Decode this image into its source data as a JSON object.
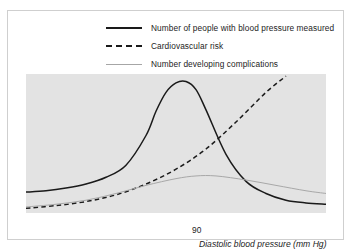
{
  "chart_data": {
    "type": "line",
    "title": "",
    "xlabel": "Diastolic blood pressure (mm Hg)",
    "ylabel": "",
    "xtick_labels": [
      "90"
    ],
    "xtick_positions": [
      90
    ],
    "grid": false,
    "legend_position": "top",
    "plot_background": "#e3e3e3",
    "series": [
      {
        "name": "Number of people with blood pressure measured",
        "style": "solid",
        "color": "#1a1a1a",
        "shape": "bell-curve peaking just left of 90, falling away to the right",
        "x": [
          60,
          64,
          68,
          72,
          76,
          80,
          84,
          86,
          88,
          90,
          92,
          94,
          96,
          100,
          104,
          108,
          112,
          116,
          120
        ],
        "y": [
          14,
          15,
          17,
          20,
          25,
          34,
          56,
          74,
          88,
          95,
          96,
          90,
          75,
          42,
          22,
          13,
          8,
          6,
          5
        ]
      },
      {
        "name": "Cardiovascular risk",
        "style": "dashed",
        "color": "#1a1a1a",
        "shape": "exponentially rising curve from bottom left to top right",
        "x": [
          60,
          66,
          72,
          78,
          84,
          90,
          96,
          102,
          108,
          112
        ],
        "y": [
          2,
          4,
          7,
          12,
          20,
          31,
          46,
          66,
          88,
          100
        ]
      },
      {
        "name": "Number developing complications",
        "style": "thin-solid",
        "color": "#a6a6a6",
        "shape": "low broad hump peaking a little above 90 then slowly declining",
        "x": [
          60,
          66,
          72,
          78,
          84,
          90,
          94,
          98,
          104,
          110,
          116,
          120
        ],
        "y": [
          3,
          5,
          8,
          13,
          19,
          24,
          26,
          26,
          23,
          19,
          15,
          13
        ]
      }
    ],
    "xlim": [
      60,
      120
    ],
    "ylim": [
      0,
      100
    ]
  },
  "legend": {
    "items": [
      {
        "label": "Number of people with blood pressure measured",
        "key": "solid-line-key"
      },
      {
        "label": "Cardiovascular risk",
        "key": "dashed-line-key"
      },
      {
        "label": "Number developing complications",
        "key": "thin-line-key"
      }
    ]
  },
  "axis": {
    "x_tick_90": "90",
    "x_label": "Diastolic blood pressure (mm Hg)"
  }
}
